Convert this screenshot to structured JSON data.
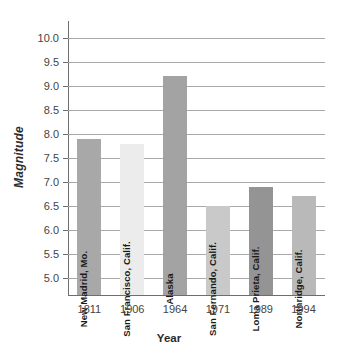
{
  "chart_data": {
    "type": "bar",
    "title": "",
    "xlabel": "Year",
    "ylabel": "Magnitude",
    "categories": [
      "1811",
      "1906",
      "1964",
      "1971",
      "1989",
      "1994"
    ],
    "values": [
      7.9,
      7.8,
      9.2,
      6.5,
      6.9,
      6.7
    ],
    "point_labels": [
      "New Madrid, Mo.",
      "San Francisco, Calif.",
      "Alaska",
      "San Fernando, Calif.",
      "Loma Prieta, Calif.",
      "Northridge, Calif."
    ],
    "bar_colors": [
      "#a8a8a8",
      "#ececec",
      "#a3a3a3",
      "#c9c9c9",
      "#949494",
      "#b9b9b9"
    ],
    "ylim": [
      4.65,
      10.35
    ],
    "yticks": [
      "10.0",
      "9.5",
      "9.0",
      "8.5",
      "8.0",
      "7.5",
      "7.0",
      "6.5",
      "6.0",
      "5.5",
      "5.0"
    ],
    "ytick_values": [
      10.0,
      9.5,
      9.0,
      8.5,
      8.0,
      7.5,
      7.0,
      6.5,
      6.0,
      5.5,
      5.0
    ],
    "grid": true,
    "legend": "none",
    "axis_color": "#6e6e6e",
    "grid_color": "#a9a9a9",
    "background": "#ffffff"
  }
}
